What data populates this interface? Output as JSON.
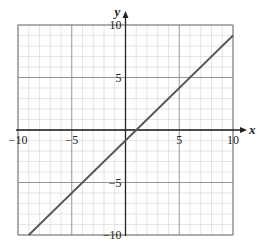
{
  "chart_data": {
    "type": "line",
    "title": "",
    "xlabel": "x",
    "ylabel": "y",
    "xlim": [
      -10,
      10
    ],
    "ylim": [
      -10,
      10
    ],
    "grid": true,
    "minor_grid_step": 1,
    "major_grid_step": 5,
    "x_ticks": [
      -10,
      -5,
      5,
      10
    ],
    "y_ticks": [
      10,
      5,
      -5,
      -10
    ],
    "x_tick_labels": [
      "−10",
      "−5",
      "5",
      "10"
    ],
    "y_tick_labels": [
      "10",
      "5",
      "−5",
      "−10"
    ],
    "legend": [],
    "series": [
      {
        "name": "y = x − 1",
        "equation": "y = x - 1",
        "x": [
          -9,
          10
        ],
        "y": [
          -10,
          9
        ],
        "color": "#555555"
      }
    ]
  },
  "colors": {
    "background": "#ffffff",
    "minor_grid": "#d4d4d4",
    "major_grid": "#8a8a8a",
    "axis": "#222222",
    "line": "#555555"
  }
}
